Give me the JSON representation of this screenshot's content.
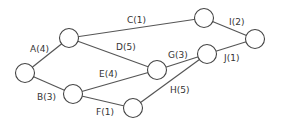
{
  "diagram": {
    "type": "network-graph",
    "nodes": [
      {
        "id": "n1",
        "x": 25,
        "y": 73
      },
      {
        "id": "n2",
        "x": 69,
        "y": 38
      },
      {
        "id": "n3",
        "x": 73,
        "y": 94
      },
      {
        "id": "n4",
        "x": 133,
        "y": 108
      },
      {
        "id": "n5",
        "x": 157,
        "y": 70
      },
      {
        "id": "n6",
        "x": 204,
        "y": 18
      },
      {
        "id": "n7",
        "x": 207,
        "y": 54
      },
      {
        "id": "n8",
        "x": 255,
        "y": 39
      }
    ],
    "edges": [
      {
        "label": "A(4)",
        "from": "n1",
        "to": "n2"
      },
      {
        "label": "B(3)",
        "from": "n1",
        "to": "n3"
      },
      {
        "label": "C(1)",
        "from": "n2",
        "to": "n6"
      },
      {
        "label": "D(5)",
        "from": "n2",
        "to": "n5"
      },
      {
        "label": "E(4)",
        "from": "n3",
        "to": "n5"
      },
      {
        "label": "F(1)",
        "from": "n3",
        "to": "n4"
      },
      {
        "label": "G(3)",
        "from": "n5",
        "to": "n7"
      },
      {
        "label": "H(5)",
        "from": "n4",
        "to": "n7"
      },
      {
        "label": "I(2)",
        "from": "n6",
        "to": "n8"
      },
      {
        "label": "J(1)",
        "from": "n7",
        "to": "n8"
      }
    ]
  }
}
